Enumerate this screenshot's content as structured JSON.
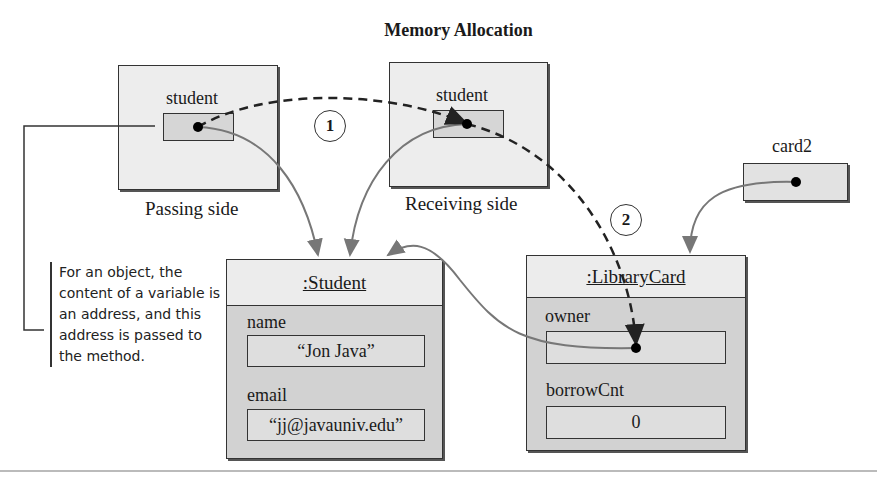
{
  "title": "Memory Allocation",
  "passing": {
    "var_label": "student",
    "side_label": "Passing side"
  },
  "receiving": {
    "var_label": "student",
    "side_label": "Receiving side"
  },
  "card2": {
    "var_label": "card2"
  },
  "steps": [
    "1",
    "2"
  ],
  "note": "For an object, the content of a variable is an address, and this address is passed to the method.",
  "student_object": {
    "class_label": ":Student",
    "fields": [
      {
        "name": "name",
        "value": "“Jon Java”"
      },
      {
        "name": "email",
        "value": "“jj@javauniv.edu”"
      }
    ]
  },
  "librarycard_object": {
    "class_label": ":LibraryCard",
    "fields": [
      {
        "name": "owner",
        "value": ""
      },
      {
        "name": "borrowCnt",
        "value": "0"
      }
    ]
  },
  "colors": {
    "frame": "#ededed",
    "slot": "#d6d6d6",
    "object_body": "#d2d2d2",
    "arrow": "#777777"
  }
}
